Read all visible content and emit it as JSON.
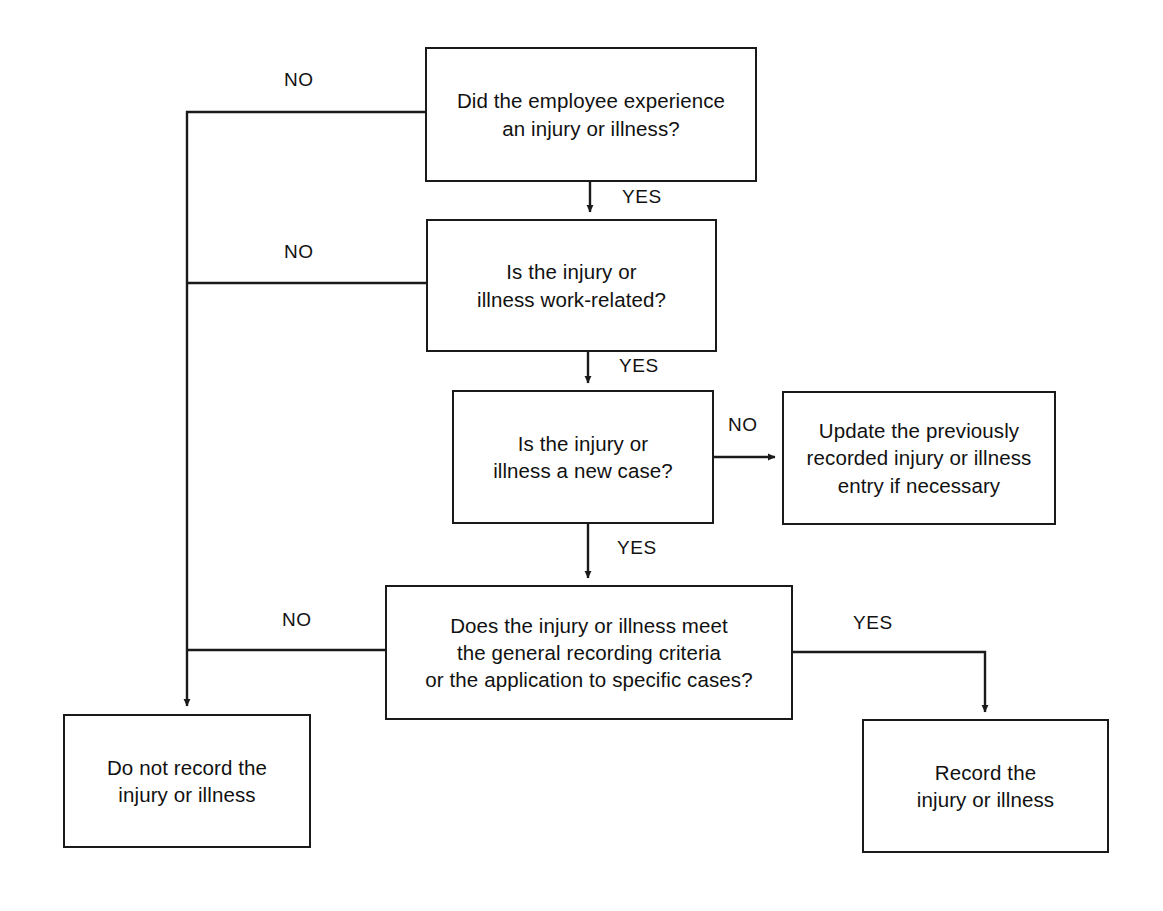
{
  "diagram": {
    "line_color": "#1a1a1a",
    "background_color": "#ffffff",
    "text_color": "#111111"
  },
  "nodes": [
    {
      "id": "did-employee-experience",
      "text": "Did the employee experience\nan injury or illness?",
      "x": 425,
      "y": 47,
      "w": 332,
      "h": 135
    },
    {
      "id": "work-related",
      "text": "Is the injury or\nillness work-related?",
      "x": 426,
      "y": 219,
      "w": 291,
      "h": 133
    },
    {
      "id": "new-case",
      "text": "Is the injury or\nillness a new case?",
      "x": 452,
      "y": 390,
      "w": 262,
      "h": 134
    },
    {
      "id": "update-previous",
      "text": "Update the previously\nrecorded injury or illness\nentry if necessary",
      "x": 782,
      "y": 391,
      "w": 274,
      "h": 134
    },
    {
      "id": "recording-criteria",
      "text": "Does the injury or illness meet\nthe general recording criteria\nor the application to specific cases?",
      "x": 385,
      "y": 585,
      "w": 408,
      "h": 135
    },
    {
      "id": "do-not-record",
      "text": "Do not record the\ninjury or illness",
      "x": 63,
      "y": 714,
      "w": 248,
      "h": 134
    },
    {
      "id": "record",
      "text": "Record the\ninjury or illness",
      "x": 862,
      "y": 719,
      "w": 247,
      "h": 134
    }
  ],
  "edge_labels": [
    {
      "id": "no-1",
      "text": "NO",
      "x": 284,
      "y": 69
    },
    {
      "id": "yes-1",
      "text": "YES",
      "x": 622,
      "y": 186
    },
    {
      "id": "no-2",
      "text": "NO",
      "x": 284,
      "y": 241
    },
    {
      "id": "yes-2",
      "text": "YES",
      "x": 619,
      "y": 355
    },
    {
      "id": "no-3",
      "text": "NO",
      "x": 728,
      "y": 414
    },
    {
      "id": "yes-3",
      "text": "YES",
      "x": 617,
      "y": 537
    },
    {
      "id": "no-4",
      "text": "NO",
      "x": 282,
      "y": 609
    },
    {
      "id": "yes-4",
      "text": "YES",
      "x": 853,
      "y": 612
    }
  ],
  "connectors": [
    {
      "id": "no-1-path",
      "from": "did-employee-experience",
      "to": "do-not-record",
      "label": "NO"
    },
    {
      "id": "yes-1-path",
      "from": "did-employee-experience",
      "to": "work-related",
      "label": "YES"
    },
    {
      "id": "no-2-path",
      "from": "work-related",
      "to": "do-not-record",
      "label": "NO"
    },
    {
      "id": "yes-2-path",
      "from": "work-related",
      "to": "new-case",
      "label": "YES"
    },
    {
      "id": "no-3-path",
      "from": "new-case",
      "to": "update-previous",
      "label": "NO"
    },
    {
      "id": "yes-3-path",
      "from": "new-case",
      "to": "recording-criteria",
      "label": "YES"
    },
    {
      "id": "no-4-path",
      "from": "recording-criteria",
      "to": "do-not-record",
      "label": "NO"
    },
    {
      "id": "yes-4-path",
      "from": "recording-criteria",
      "to": "record",
      "label": "YES"
    }
  ]
}
